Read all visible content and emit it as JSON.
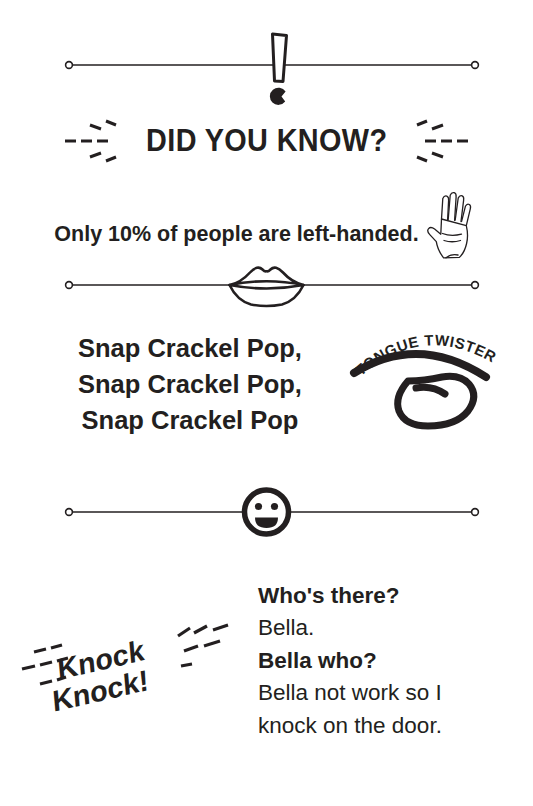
{
  "page": {
    "background_color": "#ffffff",
    "ink_color": "#231f20"
  },
  "sections": {
    "did_you_know": {
      "divider_icon": "exclamation-mark-icon",
      "heading": "DID YOU KNOW?",
      "fact": "Only 10% of people are left-handed.",
      "illustration": "open-hand-icon"
    },
    "tongue_twister": {
      "divider_icon": "lips-icon",
      "badge_label": "TONGUE TWISTER",
      "badge_icon": "tongue-icon",
      "lines": [
        "Snap Crackel Pop,",
        "Snap Crackel Pop,",
        "Snap Crackel Pop"
      ]
    },
    "knock_knock": {
      "divider_icon": "smiley-face-icon",
      "badge_line_1": "Knock",
      "badge_line_2": "Knock!",
      "who_there": "Who's there?",
      "bella": "Bella.",
      "bella_who": "Bella who?",
      "punchline": "Bella not work so I knock on the door."
    }
  }
}
